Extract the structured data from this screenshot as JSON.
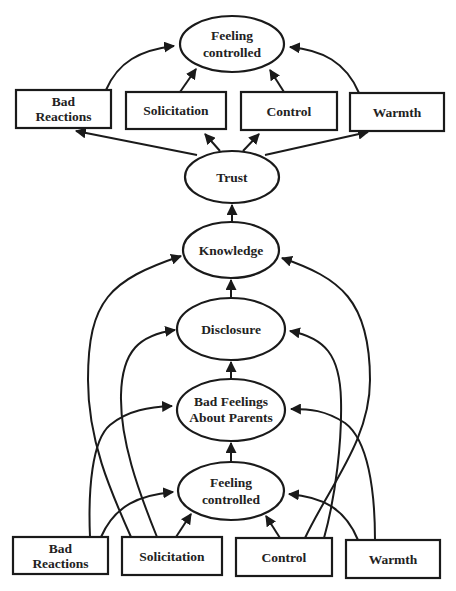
{
  "diagram": {
    "type": "path-model",
    "colors": {
      "stroke": "#1a1a1a",
      "fill": "#ffffff",
      "text": "#222222"
    },
    "top_section": {
      "outcome": {
        "id": "top-feeling-controlled",
        "shape": "ellipse",
        "lines": [
          "Feeling",
          "controlled"
        ]
      },
      "predictors": [
        {
          "id": "top-bad-reactions",
          "shape": "box",
          "lines": [
            "Bad",
            "Reactions"
          ]
        },
        {
          "id": "top-solicitation",
          "shape": "box",
          "lines": [
            "Solicitation"
          ]
        },
        {
          "id": "top-control",
          "shape": "box",
          "lines": [
            "Control"
          ]
        },
        {
          "id": "top-warmth",
          "shape": "box",
          "lines": [
            "Warmth"
          ]
        }
      ],
      "source": {
        "id": "trust",
        "shape": "ellipse",
        "lines": [
          "Trust"
        ]
      }
    },
    "chain": [
      {
        "id": "knowledge",
        "shape": "ellipse",
        "lines": [
          "Knowledge"
        ]
      },
      {
        "id": "disclosure",
        "shape": "ellipse",
        "lines": [
          "Disclosure"
        ]
      },
      {
        "id": "bad-feelings",
        "shape": "ellipse",
        "lines": [
          "Bad Feelings",
          "About Parents"
        ]
      },
      {
        "id": "bottom-feeling-controlled",
        "shape": "ellipse",
        "lines": [
          "Feeling",
          "controlled"
        ]
      }
    ],
    "bottom_predictors": [
      {
        "id": "bottom-bad-reactions",
        "shape": "box",
        "lines": [
          "Bad",
          "Reactions"
        ]
      },
      {
        "id": "bottom-solicitation",
        "shape": "box",
        "lines": [
          "Solicitation"
        ]
      },
      {
        "id": "bottom-control",
        "shape": "box",
        "lines": [
          "Control"
        ]
      },
      {
        "id": "bottom-warmth",
        "shape": "box",
        "lines": [
          "Warmth"
        ]
      }
    ],
    "edges": [
      {
        "from": "top-bad-reactions",
        "to": "top-feeling-controlled"
      },
      {
        "from": "top-solicitation",
        "to": "top-feeling-controlled"
      },
      {
        "from": "top-control",
        "to": "top-feeling-controlled"
      },
      {
        "from": "top-warmth",
        "to": "top-feeling-controlled"
      },
      {
        "from": "trust",
        "to": "top-bad-reactions"
      },
      {
        "from": "trust",
        "to": "top-solicitation"
      },
      {
        "from": "trust",
        "to": "top-control"
      },
      {
        "from": "trust",
        "to": "top-warmth"
      },
      {
        "from": "knowledge",
        "to": "trust"
      },
      {
        "from": "disclosure",
        "to": "knowledge"
      },
      {
        "from": "bad-feelings",
        "to": "disclosure"
      },
      {
        "from": "bottom-feeling-controlled",
        "to": "bad-feelings"
      },
      {
        "from": "bottom-solicitation",
        "to": "knowledge"
      },
      {
        "from": "bottom-solicitation",
        "to": "disclosure"
      },
      {
        "from": "bottom-control",
        "to": "knowledge"
      },
      {
        "from": "bottom-control",
        "to": "disclosure"
      },
      {
        "from": "bottom-bad-reactions",
        "to": "bad-feelings"
      },
      {
        "from": "bottom-warmth",
        "to": "bad-feelings"
      },
      {
        "from": "bottom-bad-reactions",
        "to": "bottom-feeling-controlled"
      },
      {
        "from": "bottom-solicitation",
        "to": "bottom-feeling-controlled"
      },
      {
        "from": "bottom-control",
        "to": "bottom-feeling-controlled"
      },
      {
        "from": "bottom-warmth",
        "to": "bottom-feeling-controlled"
      }
    ]
  }
}
